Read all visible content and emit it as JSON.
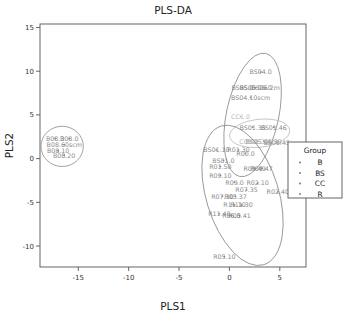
{
  "chart_data": {
    "type": "scatter",
    "title": "PLS-DA",
    "xlabel": "PLS1",
    "ylabel": "PLS2",
    "xlim": [
      -18.8,
      7.6
    ],
    "ylim": [
      -12.4,
      15.4
    ],
    "xticks": [
      "-15",
      "-10",
      "-5",
      "0",
      "5"
    ],
    "xtickvals": [
      -15,
      -10,
      -5,
      0,
      5
    ],
    "yticks": [
      "15",
      "10",
      "5",
      "0",
      "-5",
      "-10"
    ],
    "ytickvals": [
      15,
      10,
      5,
      0,
      -5,
      -10
    ],
    "grid": false,
    "legend_position": "right",
    "legend_title": "Group",
    "series": [
      {
        "name": "B",
        "color": "#8a8a8a",
        "points": [
          {
            "label": "B08.3",
            "x": -17.3,
            "y": 2.3
          },
          {
            "label": "B08.0",
            "x": -15.9,
            "y": 2.3
          },
          {
            "label": "B08.60scm",
            "x": -16.4,
            "y": 1.6
          },
          {
            "label": "B08.10",
            "x": -17.0,
            "y": 0.9
          },
          {
            "label": "B08.20",
            "x": -16.4,
            "y": 0.4
          }
        ],
        "ellipse": {
          "cx": -16.6,
          "cy": 1.4,
          "rx": 2.1,
          "ry": 2.3,
          "angle": 0
        }
      },
      {
        "name": "BS",
        "color": "#8a8a8a",
        "points": [
          {
            "label": "BS04.0",
            "x": 3.1,
            "y": 9.9
          },
          {
            "label": "BS05.0",
            "x": 1.3,
            "y": 8.1
          },
          {
            "label": "BS05.06.0",
            "x": 2.6,
            "y": 8.1
          },
          {
            "label": "BS06.2m",
            "x": 3.6,
            "y": 8.1
          },
          {
            "label": "BS04.10scm",
            "x": 2.1,
            "y": 7.0
          },
          {
            "label": "BS01.35",
            "x": 2.3,
            "y": 3.6
          },
          {
            "label": "BS01.46",
            "x": 4.4,
            "y": 3.6
          },
          {
            "label": "BS05.06.39",
            "x": 3.4,
            "y": 2.0
          },
          {
            "label": "BS01.45",
            "x": 4.7,
            "y": 1.8
          },
          {
            "label": "BS01.10",
            "x": -1.3,
            "y": 1.0
          },
          {
            "label": "BS01.0",
            "x": -0.6,
            "y": -0.2
          }
        ],
        "ellipse": {
          "cx": 2.3,
          "cy": 5.0,
          "rx": 2.6,
          "ry": 7.2,
          "angle": 12
        }
      },
      {
        "name": "CC",
        "color": "#b9b9b9",
        "points": [
          {
            "label": "CC1.0",
            "x": 1.1,
            "y": 4.8
          },
          {
            "label": "CC1.4",
            "x": 1.9,
            "y": 2.0
          },
          {
            "label": "CC1.35",
            "x": 2.8,
            "y": 2.0
          }
        ],
        "ellipse": {
          "cx": 3.0,
          "cy": 2.9,
          "rx": 3.0,
          "ry": 1.6,
          "angle": -6
        }
      },
      {
        "name": "R",
        "color": "#8a8a8a",
        "points": [
          {
            "label": "R00.0",
            "x": 1.6,
            "y": 0.6
          },
          {
            "label": "R01.30",
            "x": 0.9,
            "y": 1.0
          },
          {
            "label": "R01.50",
            "x": -0.9,
            "y": -0.9
          },
          {
            "label": "R09.49",
            "x": 2.5,
            "y": -1.1
          },
          {
            "label": "R09.47",
            "x": 3.2,
            "y": -1.1
          },
          {
            "label": "R09.10",
            "x": -0.9,
            "y": -1.9
          },
          {
            "label": "R09.0",
            "x": 0.5,
            "y": -2.7
          },
          {
            "label": "R02.10",
            "x": 2.8,
            "y": -2.8
          },
          {
            "label": "R07.35",
            "x": 1.7,
            "y": -3.6
          },
          {
            "label": "R02.40",
            "x": 4.8,
            "y": -3.8
          },
          {
            "label": "R07.30",
            "x": -0.7,
            "y": -4.3
          },
          {
            "label": "R05.37",
            "x": 0.6,
            "y": -4.3
          },
          {
            "label": "R11.10",
            "x": 0.5,
            "y": -5.3
          },
          {
            "label": "R11.30",
            "x": 1.2,
            "y": -5.3
          },
          {
            "label": "R11.40",
            "x": -1.0,
            "y": -6.3
          },
          {
            "label": "R05.41",
            "x": 1.0,
            "y": -6.5
          },
          {
            "label": "R06.0",
            "x": 0.2,
            "y": -6.5
          },
          {
            "label": "R05.10",
            "x": -0.5,
            "y": -11.2
          }
        ],
        "ellipse": {
          "cx": 1.3,
          "cy": -4.2,
          "rx": 3.6,
          "ry": 8.3,
          "angle": -17
        }
      }
    ]
  },
  "legend": {
    "title": "Group",
    "items": [
      {
        "label": "B",
        "marker": "point-marker"
      },
      {
        "label": "BS",
        "marker": "point-marker"
      },
      {
        "label": "CC",
        "marker": "point-marker"
      },
      {
        "label": "R",
        "marker": "point-marker"
      }
    ]
  }
}
